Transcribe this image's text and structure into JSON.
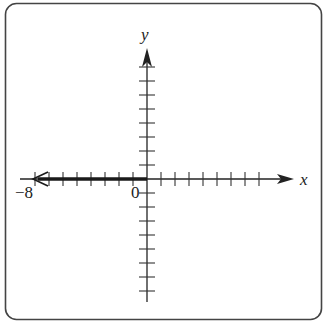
{
  "diagram": {
    "type": "number-line-on-coordinate-axes",
    "x_axis_label": "x",
    "y_axis_label": "y",
    "origin_label": "0",
    "marked_point_label": "−8",
    "x_ticks_each_side": 8,
    "y_ticks_each_side": 8,
    "ray": {
      "from": 0,
      "to": -8,
      "direction": "left",
      "endpoint": "open-arrow"
    },
    "colors": {
      "stroke": "#222222",
      "frame": "#444444"
    }
  }
}
